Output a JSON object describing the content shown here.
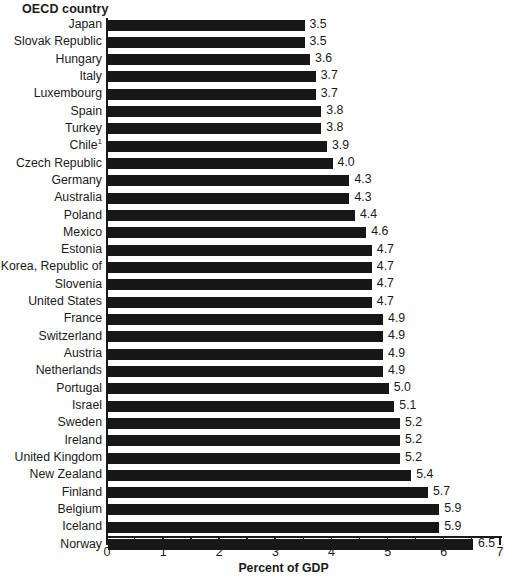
{
  "chart_data": {
    "type": "bar",
    "orientation": "horizontal",
    "title": "",
    "ylabel": "OECD country",
    "xlabel": "Percent of GDP",
    "xlim": [
      0,
      7
    ],
    "xticks": [
      0,
      1,
      2,
      3,
      4,
      5,
      6,
      7
    ],
    "xtick_labels": [
      "0",
      "1",
      "2",
      "3",
      "4",
      "5",
      "6",
      "7"
    ],
    "minor_tick_step": 0.5,
    "grid": false,
    "legend": null,
    "bar_color": "#171717",
    "categories": [
      "Japan",
      "Slovak Republic",
      "Hungary",
      "Italy",
      "Luxembourg",
      "Spain",
      "Turkey",
      "Chile¹",
      "Czech Republic",
      "Germany",
      "Australia",
      "Poland",
      "Mexico",
      "Estonia",
      "Korea, Republic of",
      "Slovenia",
      "United States",
      "France",
      "Switzerland",
      "Austria",
      "Netherlands",
      "Portugal",
      "Israel",
      "Sweden",
      "Ireland",
      "United Kingdom",
      "New Zealand",
      "Finland",
      "Belgium",
      "Iceland",
      "Norway"
    ],
    "values": [
      3.5,
      3.5,
      3.6,
      3.7,
      3.7,
      3.8,
      3.8,
      3.9,
      4.0,
      4.3,
      4.3,
      4.4,
      4.6,
      4.7,
      4.7,
      4.7,
      4.7,
      4.9,
      4.9,
      4.9,
      4.9,
      5.0,
      5.1,
      5.2,
      5.2,
      5.2,
      5.4,
      5.7,
      5.9,
      5.9,
      6.5
    ],
    "value_labels": [
      "3.5",
      "3.5",
      "3.6",
      "3.7",
      "3.7",
      "3.8",
      "3.8",
      "3.9",
      "4.0",
      "4.3",
      "4.3",
      "4.4",
      "4.6",
      "4.7",
      "4.7",
      "4.7",
      "4.7",
      "4.9",
      "4.9",
      "4.9",
      "4.9",
      "5.0",
      "5.1",
      "5.2",
      "5.2",
      "5.2",
      "5.4",
      "5.7",
      "5.9",
      "5.9",
      "6.5"
    ]
  }
}
